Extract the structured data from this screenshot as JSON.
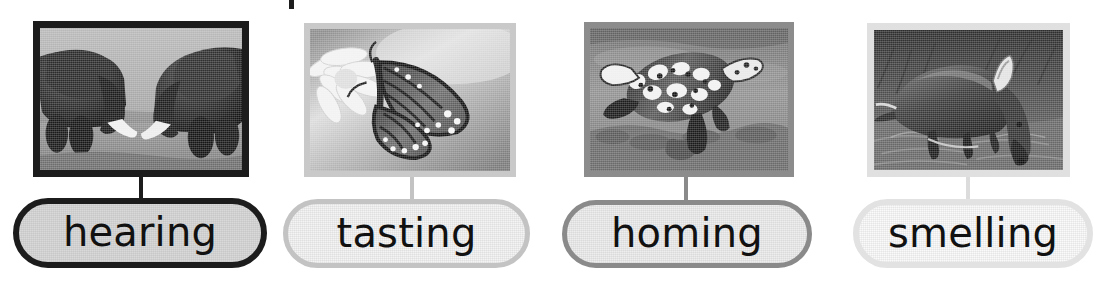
{
  "page": {
    "background_color": "#ffffff",
    "width": 1108,
    "height": 288,
    "cropped_title_remnant": "|"
  },
  "panels": [
    {
      "id": "hearing",
      "label": "hearing",
      "photo_alt": "two elephants touching trunks and tusks",
      "photo_subject": "elephants",
      "border_color": "#1c1c1c",
      "pill_border_color": "#1c1c1c",
      "pill_fill_color": "#d9d9d9",
      "connector_color": "#1c1c1c",
      "photo": {
        "x": 33,
        "y": 21,
        "width": 216,
        "height": 156,
        "border_width": 7
      },
      "pill": {
        "x": 13,
        "y": 198,
        "width": 254,
        "height": 70,
        "border_width": 6
      },
      "connector": {
        "x": 139,
        "y": 177,
        "height": 22
      }
    },
    {
      "id": "tasting",
      "label": "tasting",
      "photo_alt": "monarch butterfly perched on a white daisy flower",
      "photo_subject": "butterfly",
      "border_color": "#c9c9c9",
      "pill_border_color": "#c3c3c3",
      "pill_fill_color": "#f4f4f4",
      "connector_color": "#c3c3c3",
      "photo": {
        "x": 304,
        "y": 23,
        "width": 212,
        "height": 154,
        "border_width": 6
      },
      "pill": {
        "x": 283,
        "y": 199,
        "width": 247,
        "height": 69,
        "border_width": 5
      },
      "connector": {
        "x": 410,
        "y": 177,
        "height": 22
      }
    },
    {
      "id": "homing",
      "label": "homing",
      "photo_alt": "sea turtle swimming underwater above a reef",
      "photo_subject": "sea turtle",
      "border_color": "#8c8c8c",
      "pill_border_color": "#8a8a8a",
      "pill_fill_color": "#eeeeee",
      "connector_color": "#8a8a8a",
      "photo": {
        "x": 584,
        "y": 22,
        "width": 210,
        "height": 155,
        "border_width": 6
      },
      "pill": {
        "x": 562,
        "y": 200,
        "width": 250,
        "height": 68,
        "border_width": 5
      },
      "connector": {
        "x": 684,
        "y": 177,
        "height": 23
      }
    },
    {
      "id": "smelling",
      "label": "smelling",
      "photo_alt": "aardvark foraging with its snout on the ground at night",
      "photo_subject": "aardvark",
      "border_color": "#e0e0e0",
      "pill_border_color": "#e2e2e2",
      "pill_fill_color": "#fafafa",
      "connector_color": "#dcdcdc",
      "photo": {
        "x": 867,
        "y": 23,
        "width": 203,
        "height": 154,
        "border_width": 7
      },
      "pill": {
        "x": 853,
        "y": 199,
        "width": 240,
        "height": 69,
        "border_width": 6
      },
      "connector": {
        "x": 966,
        "y": 177,
        "height": 22
      }
    }
  ]
}
